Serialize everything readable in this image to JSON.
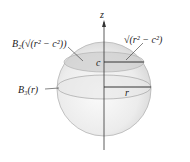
{
  "diagram": {
    "title": "",
    "axis": {
      "label": "z"
    },
    "labels": {
      "cap_disk": "B₂(√(r² − c²))",
      "cap_radius": "√(r² − c²)",
      "height": "c",
      "equator_disk": "B₃(r)",
      "radius": "r"
    }
  }
}
